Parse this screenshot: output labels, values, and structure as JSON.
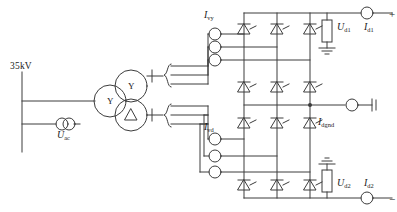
{
  "diagram": {
    "stroke_color": "#3c3c3c",
    "text_color": "#1a1a1a"
  },
  "ac_side": {
    "bus_voltage_label": "35kV",
    "source_label_main": "U",
    "source_label_sub": "ac"
  },
  "transformer": {
    "primary_winding_symbol": "Y",
    "secondary_upper_winding_symbol": "Y",
    "secondary_lower_winding_symbol": "△"
  },
  "valves": {
    "upper_valve_current_main": "I",
    "upper_valve_current_sub": "vy",
    "lower_valve_current_main": "I",
    "lower_valve_current_sub": "vd"
  },
  "dc_side": {
    "pole1_voltage_main": "U",
    "pole1_voltage_sub": "d1",
    "pole1_current_main": "I",
    "pole1_current_sub": "d1",
    "pole1_polarity": "+",
    "pole2_voltage_main": "U",
    "pole2_voltage_sub": "d2",
    "pole2_current_main": "I",
    "pole2_current_sub": "d2",
    "pole2_polarity": "−",
    "ground_current_main": "I",
    "ground_current_sub": "dgnd"
  }
}
